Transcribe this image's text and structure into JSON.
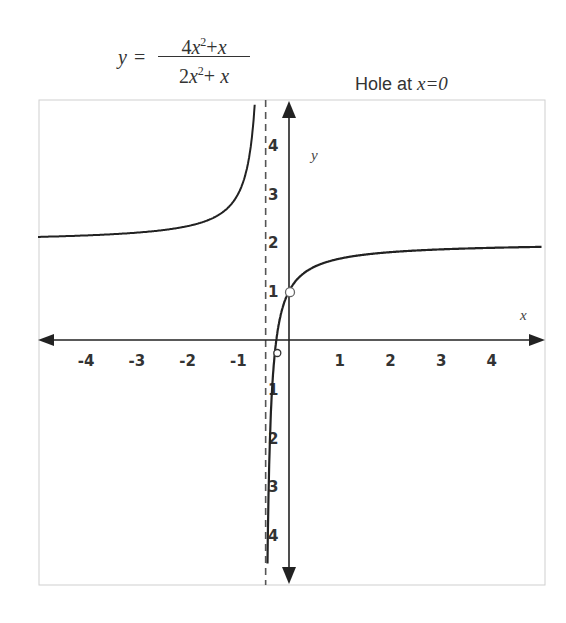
{
  "chart_data": {
    "type": "line",
    "equation": {
      "lhs": "y",
      "numerator": "4x^2+x",
      "denominator": "2x^2+ x"
    },
    "annotation": "Hole at x=0",
    "xlabel": "x",
    "ylabel": "y",
    "xlim": [
      -5,
      5
    ],
    "ylim": [
      -5,
      5
    ],
    "x_ticks": [
      -4,
      -3,
      -2,
      -1,
      1,
      2,
      3,
      4
    ],
    "y_ticks": [
      4,
      3,
      2,
      1,
      -1,
      -2,
      -3,
      -4
    ],
    "grid": false,
    "vertical_asymptote": {
      "x": -0.5,
      "style": "dashed"
    },
    "horizontal_asymptote": {
      "y": 2,
      "drawn": false
    },
    "hole": {
      "x": 0,
      "y": 1,
      "style": "open-circle"
    },
    "marked_point": {
      "x": -0.25,
      "y": 0,
      "style": "open-circle"
    },
    "series": [
      {
        "name": "left branch",
        "x": [
          -5,
          -4,
          -3,
          -2,
          -1.5,
          -1,
          -0.8,
          -0.7,
          -0.6,
          -0.55
        ],
        "y": [
          2.11,
          2.14,
          2.2,
          2.33,
          2.5,
          3.0,
          3.67,
          4.5,
          7.0,
          12.0
        ]
      },
      {
        "name": "right branch",
        "x": [
          -0.45,
          -0.4,
          -0.35,
          -0.3,
          -0.25,
          -0.2,
          -0.1,
          0,
          0.5,
          1,
          2,
          3,
          4,
          5
        ],
        "y": [
          -8.0,
          -3.0,
          -1.33,
          -0.5,
          0,
          0.33,
          0.75,
          1.0,
          1.5,
          1.67,
          1.8,
          1.86,
          1.89,
          1.91
        ]
      }
    ]
  },
  "header": {
    "equation_lhs": "y",
    "equation_eq": "=",
    "annotation_prefix": "Hole at ",
    "annotation_math": "x=0"
  },
  "axes": {
    "x_name": "x",
    "y_name": "y",
    "x_tick_labels": [
      "-4",
      "-3",
      "-2",
      "-1",
      "1",
      "2",
      "3",
      "4"
    ],
    "y_tick_labels": [
      "4",
      "3",
      "2",
      "1",
      "1",
      "2",
      "3",
      "4"
    ]
  },
  "colors": {
    "curve": "#222222",
    "axis": "#222222",
    "frame": "#cccccc",
    "text": "#333333"
  }
}
